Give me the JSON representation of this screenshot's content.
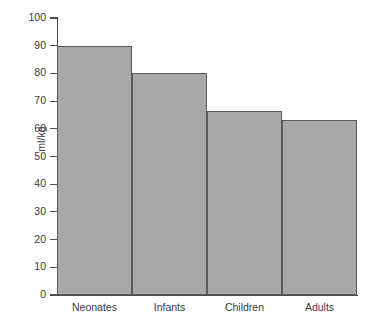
{
  "chart_data": {
    "type": "bar",
    "title": "",
    "subtitle": "",
    "xlabel": "",
    "ylabel": "ml/kg",
    "categories": [
      "Neonates",
      "Infants",
      "Children",
      "Adults"
    ],
    "values": [
      90,
      80,
      66.5,
      63
    ],
    "series": [
      {
        "name": "Blood volume",
        "values": [
          90,
          80,
          66.5,
          63
        ]
      }
    ],
    "ylim": [
      0,
      100
    ],
    "ytick_labels": [
      "100",
      "90",
      "80",
      "70",
      "60",
      "50",
      "40",
      "30",
      "20",
      "10",
      "0"
    ],
    "ytick_values": [
      100,
      90,
      80,
      70,
      60,
      50,
      40,
      30,
      20,
      10,
      0
    ],
    "grid": false,
    "legend": false,
    "legend_position": "none",
    "bar_gap": 0,
    "annotations": [],
    "colors": {
      "bar_fill": "#a8a8a8",
      "bar_stroke": "#5a5a5a",
      "axis": "#4d4d4d",
      "text": "#3a3a3a",
      "background": "#ffffff"
    }
  }
}
